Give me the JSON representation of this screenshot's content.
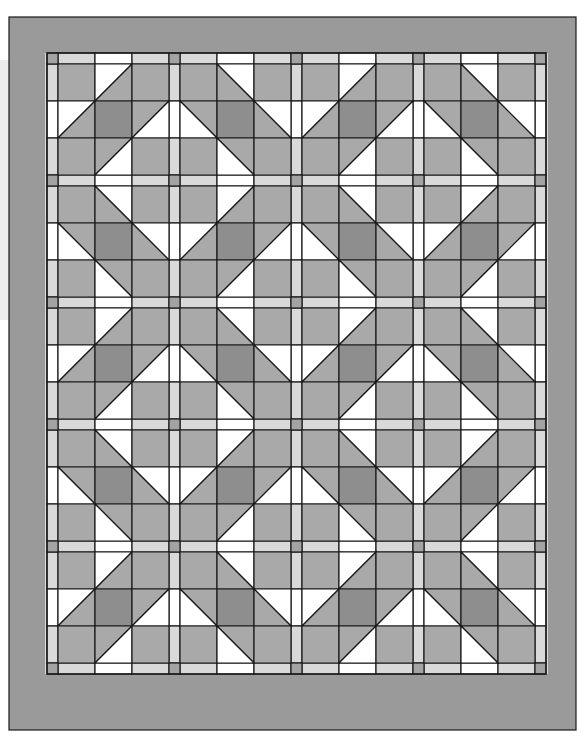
{
  "quilt": {
    "blocks_across": 4,
    "blocks_down": 5,
    "block_grid": 3,
    "pattern": "checkerboard of mirrored diagonal nine-patch blocks",
    "block_types": {
      "A": "diagonal '/' — white triangles upper-left of band",
      "B": "diagonal '\\' — mirrored"
    },
    "layout_rule": "row+col even -> A, odd -> B"
  },
  "geometry": {
    "border_outer": [
      9,
      17,
      576,
      730
    ],
    "inner_left": 47,
    "inner_top": 53,
    "sash_width": 11,
    "cell_size": 37
  },
  "colors": {
    "border": "#9a9a9a",
    "medium": "#a9a9a9",
    "dark": "#8e8e8e",
    "light_sash": "#d9d9d9",
    "cornerstone": "#a3a3a3",
    "white": "#ffffff",
    "line": "#1a1a1a",
    "background": "#ffffff",
    "shadow_strip": "#ececec"
  }
}
